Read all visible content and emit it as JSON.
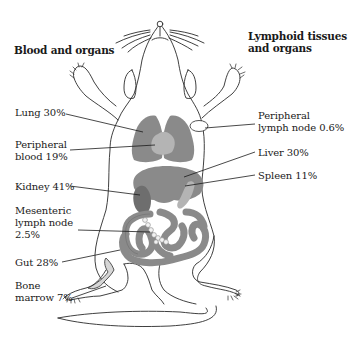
{
  "headings": {
    "left": "Blood and organs",
    "right_line1": "Lymphoid tissues",
    "right_line2": "and organs"
  },
  "labels": {
    "lung": "Lung 30%",
    "peripheral_blood_1": "Peripheral",
    "peripheral_blood_2": "blood 19%",
    "kidney": "Kidney 41%",
    "mesenteric_1": "Mesenteric",
    "mesenteric_2": "lymph node",
    "mesenteric_3": "2.5%",
    "gut": "Gut 28%",
    "bone_marrow_1": "Bone",
    "bone_marrow_2": "marrow 7%",
    "peripheral_ln_1": "Peripheral",
    "peripheral_ln_2": "lymph node 0.6%",
    "liver": "Liver 30%",
    "spleen": "Spleen 11%"
  },
  "organs": [
    {
      "name": "Lung",
      "percent": 30,
      "group": "Blood and organs"
    },
    {
      "name": "Peripheral blood",
      "percent": 19,
      "group": "Blood and organs"
    },
    {
      "name": "Kidney",
      "percent": 41,
      "group": "Blood and organs"
    },
    {
      "name": "Gut",
      "percent": 28,
      "group": "Blood and organs"
    },
    {
      "name": "Liver",
      "percent": 30,
      "group": "Blood and organs"
    },
    {
      "name": "Mesenteric lymph node",
      "percent": 2.5,
      "group": "Lymphoid tissues and organs"
    },
    {
      "name": "Bone marrow",
      "percent": 7,
      "group": "Lymphoid tissues and organs"
    },
    {
      "name": "Peripheral lymph node",
      "percent": 0.6,
      "group": "Lymphoid tissues and organs"
    },
    {
      "name": "Spleen",
      "percent": 11,
      "group": "Lymphoid tissues and organs"
    }
  ],
  "colors": {
    "outline": "#2a2a2a",
    "organ_mid": "#8a8a8a",
    "organ_dark": "#6e6e6e",
    "organ_light": "#b4b4b4",
    "bone_marrow": "#d6d6d6",
    "lymph_node": "#f2f2f2"
  }
}
